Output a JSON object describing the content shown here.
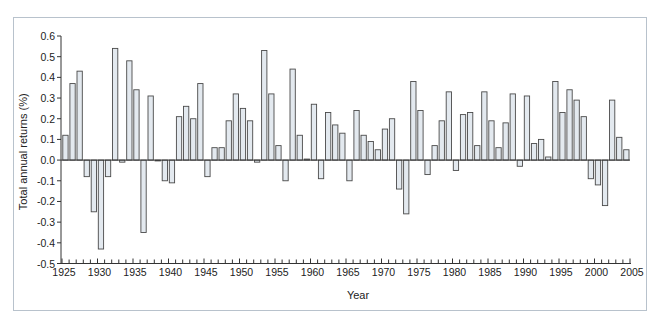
{
  "chart_data": {
    "type": "bar",
    "title": "",
    "xlabel": "Year",
    "ylabel": "Total annual returns (%)",
    "ylim": [
      -0.5,
      0.6
    ],
    "xlim": [
      1925,
      2005
    ],
    "yticks": [
      "0.6",
      "0.5",
      "0.4",
      "0.3",
      "0.2",
      "0.1",
      "0.0",
      "-0.1",
      "-0.2",
      "-0.3",
      "-0.4",
      "-0.5"
    ],
    "xticks": [
      "1925",
      "1930",
      "1935",
      "1940",
      "1945",
      "1950",
      "1955",
      "1960",
      "1965",
      "1970",
      "1975",
      "1980",
      "1985",
      "1990",
      "1995",
      "2000",
      "2005"
    ],
    "grid": false,
    "legend": null,
    "categories": [
      1926,
      1927,
      1928,
      1929,
      1930,
      1931,
      1932,
      1933,
      1934,
      1935,
      1936,
      1937,
      1938,
      1939,
      1940,
      1941,
      1942,
      1943,
      1944,
      1945,
      1946,
      1947,
      1948,
      1949,
      1950,
      1951,
      1952,
      1953,
      1954,
      1955,
      1956,
      1957,
      1958,
      1959,
      1960,
      1961,
      1962,
      1963,
      1964,
      1965,
      1966,
      1967,
      1968,
      1969,
      1970,
      1971,
      1972,
      1973,
      1974,
      1975,
      1976,
      1977,
      1978,
      1979,
      1980,
      1981,
      1982,
      1983,
      1984,
      1985,
      1986,
      1987,
      1988,
      1989,
      1990,
      1991,
      1992,
      1993,
      1994,
      1995,
      1996,
      1997,
      1998,
      1999,
      2000,
      2001,
      2002,
      2003,
      2004,
      2005
    ],
    "values": [
      0.12,
      0.37,
      0.43,
      -0.08,
      -0.25,
      -0.43,
      -0.08,
      0.54,
      -0.01,
      0.48,
      0.34,
      -0.35,
      0.31,
      -0.004,
      -0.1,
      -0.11,
      0.21,
      0.26,
      0.2,
      0.37,
      -0.08,
      0.06,
      0.06,
      0.19,
      0.32,
      0.25,
      0.19,
      -0.01,
      0.53,
      0.32,
      0.07,
      -0.1,
      0.44,
      0.12,
      0.005,
      0.27,
      -0.09,
      0.23,
      0.17,
      0.13,
      -0.1,
      0.24,
      0.12,
      0.09,
      0.05,
      0.15,
      0.2,
      -0.14,
      -0.26,
      0.38,
      0.24,
      -0.07,
      0.07,
      0.19,
      0.33,
      -0.05,
      0.22,
      0.23,
      0.07,
      0.33,
      0.19,
      0.06,
      0.18,
      0.32,
      -0.03,
      0.31,
      0.08,
      0.1,
      0.015,
      0.38,
      0.23,
      0.34,
      0.29,
      0.21,
      -0.09,
      -0.12,
      -0.22,
      0.29,
      0.11,
      0.05
    ]
  },
  "style": {
    "bar_fill": "#e3e9ef",
    "bar_stroke": "#4a4a4a",
    "frame_border": "#b8c2cc"
  }
}
